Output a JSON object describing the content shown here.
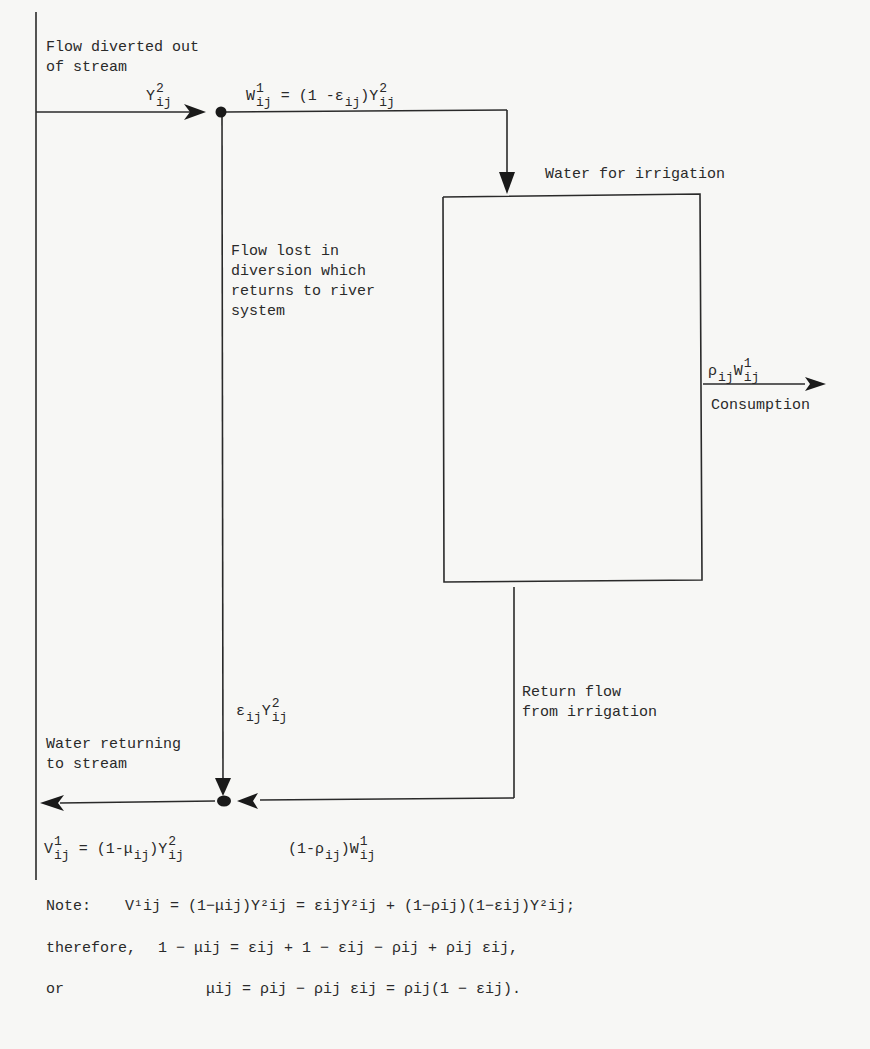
{
  "diagram": {
    "type": "flow diagram",
    "labels": {
      "diverted": "Flow diverted out\nof stream",
      "irrigation": "Water for irrigation",
      "lost": "Flow lost in\ndiversion which\nreturns to river\nsystem",
      "consumption": "Consumption",
      "return_flow": "Return flow\nfrom irrigation",
      "returning": "Water returning\nto stream"
    },
    "symbols": {
      "Y": "Y",
      "W": "W",
      "V": "V",
      "sub": "ij",
      "sup1": "1",
      "sup2": "2",
      "eps": "ε",
      "rho": "ρ",
      "mu": "μ"
    },
    "equations": {
      "w_eq": "W¹ij = (1 − εij)Y²ij",
      "consumption_eq": "ρij W¹ij",
      "lost_eq": "εij Y²ij",
      "v_eq": "V¹ij = (1−μij)Y²ij",
      "return_eq": "(1−ρij)W¹ij"
    },
    "notes": {
      "note_label": "Note:",
      "note_eq": "V¹ij = (1−μij)Y²ij = εijY²ij + (1−ρij)(1−εij)Y²ij;",
      "therefore_label": "therefore,",
      "therefore_eq": "1 − μij = εij + 1 − εij − ρij + ρij εij,",
      "or_label": "or",
      "or_eq": "μij = ρij − ρij εij = ρij(1 − εij)."
    },
    "colors": {
      "ink": "#2a2a2a",
      "paper": "#f7f7f5"
    }
  }
}
